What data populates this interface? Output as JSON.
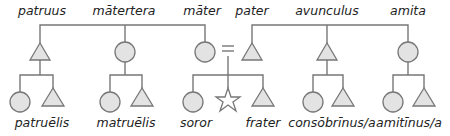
{
  "diagram": {
    "colors": {
      "line": "#777777",
      "fill": "#e3e3e3",
      "text": "#222222"
    },
    "top_labels": {
      "patruus": "patruus",
      "matertera": "mātertera",
      "mater": "māter",
      "pater": "pater",
      "avunculus": "avunculus",
      "amita": "amita"
    },
    "bottom_labels": {
      "patruelis": "patruēlis",
      "matruelis": "matruēlis",
      "soror": "soror",
      "frater": "frater",
      "consobrinus": "consōbrīnus/a",
      "amitinus": "amitīnus/a"
    },
    "marriage_symbol": "=",
    "legend": {
      "triangle": "male",
      "circle": "female",
      "star": "ego"
    }
  }
}
